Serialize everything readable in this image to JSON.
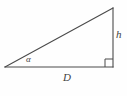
{
  "figure": {
    "kind": "right-triangle-diagram",
    "background_color": "#fefefe",
    "stroke_color": "#4a4a4a",
    "stroke_width": 1.1,
    "width": 127,
    "height": 96,
    "vertices": {
      "left_vertex": {
        "x": 5,
        "y": 67
      },
      "right_angle_vertex": {
        "x": 113,
        "y": 67
      },
      "apex_vertex": {
        "x": 113,
        "y": 8
      }
    },
    "edges": [
      {
        "name": "base",
        "from": "left_vertex",
        "to": "right_angle_vertex",
        "label": "D"
      },
      {
        "name": "vertical-leg",
        "from": "right_angle_vertex",
        "to": "apex_vertex",
        "label": "h"
      },
      {
        "name": "hypotenuse",
        "from": "left_vertex",
        "to": "apex_vertex",
        "label": ""
      }
    ],
    "right_angle_marker": {
      "x": 105,
      "y": 59,
      "size": 8
    },
    "labels": {
      "angle": "α",
      "base": "D",
      "height": "h"
    }
  }
}
